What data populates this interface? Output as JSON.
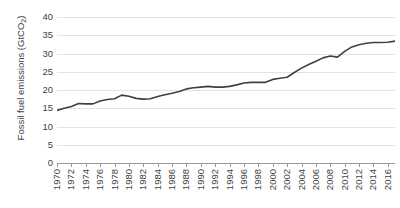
{
  "chart_data": {
    "type": "line",
    "title": "",
    "xlabel": "",
    "ylabel": "Fossil fuel emissions (GtCO2)",
    "ylabel_prefix": "Fossil fuel emissions (GtCO",
    "ylabel_subscript": "2",
    "ylabel_suffix": ")",
    "ylim": [
      0,
      40
    ],
    "xlim": [
      1970,
      2017
    ],
    "grid": true,
    "legend": "none",
    "y_ticks": [
      40,
      35,
      30,
      25,
      20,
      15,
      10,
      5,
      0
    ],
    "x_tick_labels": [
      "1970",
      "1972",
      "1974",
      "1976",
      "1978",
      "1980",
      "1982",
      "1984",
      "1986",
      "1988",
      "1990",
      "1992",
      "1994",
      "1996",
      "1998",
      "2000",
      "2002",
      "2004",
      "2006",
      "2008",
      "2010",
      "2012",
      "2014",
      "2016"
    ],
    "series_name": "Fossil fuel emissions",
    "line_color": "#404040",
    "grid_color": "#e2e2e2",
    "axis_color": "#9a9a9a",
    "text_color": "#3f3f3f",
    "x": [
      1970,
      1971,
      1972,
      1973,
      1974,
      1975,
      1976,
      1977,
      1978,
      1979,
      1980,
      1981,
      1982,
      1983,
      1984,
      1985,
      1986,
      1987,
      1988,
      1989,
      1990,
      1991,
      1992,
      1993,
      1994,
      1995,
      1996,
      1997,
      1998,
      1999,
      2000,
      2001,
      2002,
      2003,
      2004,
      2005,
      2006,
      2007,
      2008,
      2009,
      2010,
      2011,
      2012,
      2013,
      2014,
      2015,
      2016,
      2017
    ],
    "values": [
      14.4,
      15.0,
      15.5,
      16.3,
      16.2,
      16.2,
      17.0,
      17.4,
      17.6,
      18.6,
      18.3,
      17.7,
      17.5,
      17.6,
      18.2,
      18.7,
      19.1,
      19.6,
      20.3,
      20.6,
      20.8,
      21.0,
      20.8,
      20.8,
      21.0,
      21.4,
      21.9,
      22.1,
      22.1,
      22.1,
      22.9,
      23.2,
      23.5,
      24.8,
      26.0,
      27.0,
      27.9,
      28.8,
      29.3,
      29.0,
      30.6,
      31.8,
      32.4,
      32.8,
      33.0,
      33.0,
      33.1,
      33.4
    ]
  }
}
